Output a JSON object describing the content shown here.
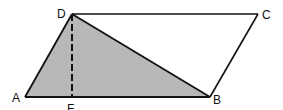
{
  "diagram": {
    "type": "geometry-figure",
    "shape": "parallelogram",
    "name": "ABCD",
    "colors": {
      "stroke": "#111111",
      "shaded_fill": "#b8b8b8",
      "background": "#ffffff"
    },
    "points": {
      "A": {
        "label": "A",
        "x": 25,
        "y": 97
      },
      "B": {
        "label": "B",
        "x": 210,
        "y": 97
      },
      "C": {
        "label": "C",
        "x": 258,
        "y": 14
      },
      "D": {
        "label": "D",
        "x": 72,
        "y": 14
      },
      "F": {
        "label": "F",
        "x": 72,
        "y": 97
      }
    },
    "labels": {
      "A": "A",
      "B": "B",
      "C": "C",
      "D": "D",
      "F": "F"
    },
    "segments": [
      {
        "from": "A",
        "to": "B",
        "style": "solid"
      },
      {
        "from": "B",
        "to": "C",
        "style": "solid"
      },
      {
        "from": "C",
        "to": "D",
        "style": "solid"
      },
      {
        "from": "D",
        "to": "A",
        "style": "solid"
      },
      {
        "from": "D",
        "to": "B",
        "style": "solid",
        "role": "diagonal"
      },
      {
        "from": "D",
        "to": "F",
        "style": "dashed",
        "role": "height"
      }
    ],
    "shaded_region": {
      "vertices": [
        "A",
        "B",
        "D"
      ],
      "name": "triangle ABD"
    }
  }
}
